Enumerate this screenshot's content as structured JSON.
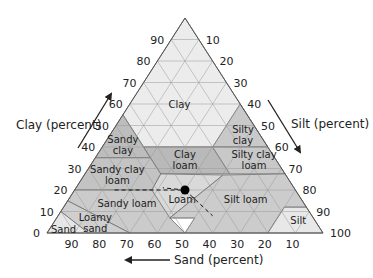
{
  "diagram": {
    "geometry": {
      "apex": [
        185,
        18
      ],
      "left": [
        47,
        233
      ],
      "right": [
        323,
        233
      ]
    },
    "axes": {
      "clay": {
        "label": "Clay (percent)",
        "ticks": [
          "0",
          "10",
          "20",
          "30",
          "40",
          "50",
          "60",
          "70",
          "80",
          "90"
        ]
      },
      "silt": {
        "label": "Silt (percent)",
        "ticks": [
          "10",
          "20",
          "30",
          "40",
          "50",
          "60",
          "70",
          "80",
          "90",
          "100"
        ]
      },
      "sand": {
        "label": "Sand (percent)",
        "ticks": [
          "90",
          "80",
          "70",
          "60",
          "50",
          "40",
          "30",
          "20",
          "10"
        ]
      }
    },
    "regions": [
      {
        "name": "Clay",
        "color": "#ececec",
        "lines": [
          "Clay"
        ],
        "label_at": [
          22,
          18,
          60
        ],
        "vertices": [
          [
            0,
            40,
            60
          ],
          [
            0,
            60,
            40
          ],
          [
            45,
            15,
            40
          ],
          [
            45,
            0,
            55
          ],
          [
            0,
            0,
            100
          ]
        ]
      },
      {
        "name": "Sandy clay",
        "color": "#bdbdbd",
        "lines": [
          "Sandy",
          "clay"
        ],
        "label_at": [
          52,
          7,
          41
        ],
        "vertices": [
          [
            45,
            0,
            55
          ],
          [
            45,
            20,
            35
          ],
          [
            65,
            0,
            35
          ]
        ]
      },
      {
        "name": "Silty clay",
        "color": "#c9c9c9",
        "lines": [
          "Silty",
          "clay"
        ],
        "label_at": [
          6,
          48,
          46
        ],
        "vertices": [
          [
            0,
            40,
            60
          ],
          [
            0,
            60,
            40
          ],
          [
            20,
            40,
            40
          ]
        ]
      },
      {
        "name": "Sandy clay loam",
        "color": "#c3c3c3",
        "lines": [
          "Sandy clay",
          "loam"
        ],
        "label_at": [
          61,
          12,
          27
        ],
        "vertices": [
          [
            45,
            20,
            35
          ],
          [
            65,
            0,
            35
          ],
          [
            80,
            0,
            20
          ],
          [
            52,
            28,
            20
          ],
          [
            45,
            27.5,
            27.5
          ]
        ]
      },
      {
        "name": "Clay loam",
        "color": "#b9b9b9",
        "lines": [
          "Clay",
          "loam"
        ],
        "label_at": [
          33,
          33,
          34
        ],
        "vertices": [
          [
            45,
            27.5,
            27.5
          ],
          [
            20,
            52.5,
            27.5
          ],
          [
            20,
            40,
            40
          ],
          [
            45,
            15,
            40
          ]
        ]
      },
      {
        "name": "Silty clay loam",
        "color": "#c8c8c8",
        "lines": [
          "Silty clay",
          "loam"
        ],
        "label_at": [
          8,
          58,
          34
        ],
        "vertices": [
          [
            0,
            60,
            40
          ],
          [
            20,
            40,
            40
          ],
          [
            20,
            52.5,
            27.5
          ],
          [
            0,
            72.5,
            27.5
          ]
        ]
      },
      {
        "name": "Sandy loam",
        "color": "#cbcbcb",
        "lines": [
          "Sandy loam"
        ],
        "label_at": [
          64,
          22,
          14
        ],
        "vertices": [
          [
            52,
            28,
            20
          ],
          [
            80,
            0,
            20
          ],
          [
            85,
            0,
            15
          ],
          [
            70,
            30,
            0
          ],
          [
            50,
            50,
            0
          ],
          [
            52,
            41,
            7
          ],
          [
            43,
            50,
            7
          ],
          [
            52,
            28,
            20
          ]
        ]
      },
      {
        "name": "Loam",
        "color": "#d9d9d9",
        "lines": [
          "Loam"
        ],
        "label_at": [
          43,
          41,
          16
        ],
        "vertices": [
          [
            45,
            27.5,
            27.5
          ],
          [
            52,
            28,
            20
          ],
          [
            52,
            41,
            7
          ],
          [
            23,
            50,
            27.5
          ]
        ]
      },
      {
        "name": "Silt loam",
        "color": "#cccccc",
        "lines": [
          "Silt loam"
        ],
        "label_at": [
          20,
          64,
          16
        ],
        "vertices": [
          [
            23,
            50,
            27.5
          ],
          [
            0,
            72.5,
            27.5
          ],
          [
            0,
            88,
            12
          ],
          [
            8,
            80,
            12
          ],
          [
            20,
            80,
            0
          ],
          [
            50,
            50,
            0
          ],
          [
            43,
            50,
            7
          ],
          [
            52,
            41,
            7
          ]
        ]
      },
      {
        "name": "Silt",
        "color": "#e8e8e8",
        "lines": [
          "Silt"
        ],
        "label_at": [
          6,
          88,
          6
        ],
        "vertices": [
          [
            0,
            88,
            12
          ],
          [
            8,
            80,
            12
          ],
          [
            20,
            80,
            0
          ],
          [
            0,
            100,
            0
          ]
        ]
      },
      {
        "name": "Loamy sand",
        "color": "#cfcfcf",
        "lines": [
          "Loamy",
          "sand"
        ],
        "label_at": [
          80,
          15,
          5
        ],
        "vertices": [
          [
            85,
            0,
            15
          ],
          [
            70,
            30,
            0
          ],
          [
            85,
            15,
            0
          ],
          [
            90,
            0,
            10
          ]
        ]
      },
      {
        "name": "Sand",
        "color": "#e6e6e6",
        "lines": [
          "Sand"
        ],
        "label_at": [
          93,
          5,
          2
        ],
        "vertices": [
          [
            90,
            0,
            10
          ],
          [
            85,
            15,
            0
          ],
          [
            100,
            0,
            0
          ]
        ]
      }
    ],
    "sample_point": {
      "sand": 40,
      "silt": 40,
      "clay": 20,
      "color": "#000000"
    }
  }
}
